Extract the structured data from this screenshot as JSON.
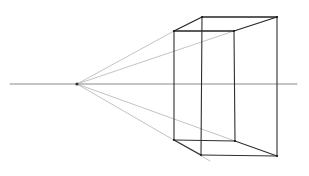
{
  "figure": {
    "type": "one-point perspective sketch",
    "width": 309,
    "height": 176,
    "background": "#ffffff",
    "horizon": {
      "x1": 10,
      "x2": 297,
      "y": 84,
      "color": "#8a8a8a"
    },
    "vanishing_point": {
      "x": 77,
      "y": 84
    },
    "box": {
      "top_front_left": [
        174,
        31
      ],
      "top_front_right": [
        234,
        31
      ],
      "top_back_left": [
        202,
        17
      ],
      "top_back_right": [
        277,
        17
      ],
      "bottom_front_left": [
        174,
        140
      ],
      "bottom_front_right": [
        235,
        141
      ],
      "bottom_back_left": [
        201,
        155
      ],
      "bottom_back_right": [
        277,
        156
      ],
      "edge_color": "#2f2f2f"
    },
    "guidelines": [
      {
        "from": "vanishing_point",
        "to": [
          174,
          31
        ]
      },
      {
        "from": "vanishing_point",
        "to": [
          234,
          31
        ]
      },
      {
        "from": "vanishing_point",
        "to": [
          235,
          141
        ]
      },
      {
        "from": "vanishing_point",
        "to": [
          210,
          161
        ]
      }
    ],
    "guide_color": "#b4b4b4"
  }
}
